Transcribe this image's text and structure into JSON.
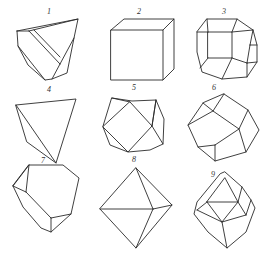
{
  "figure": {
    "title": "",
    "layout": "3x3 grid",
    "line_color": "#2a2a2a",
    "background": "#ffffff"
  },
  "crystals": [
    {
      "label": "1",
      "shape": "irregular truncated crystal with diagonal face"
    },
    {
      "label": "2",
      "shape": "cube"
    },
    {
      "label": "3",
      "shape": "truncated cube / cuboctahedral form"
    },
    {
      "label": "4",
      "shape": "tetrahedron"
    },
    {
      "label": "5",
      "shape": "cuboctahedron"
    },
    {
      "label": "6",
      "shape": "rhombic dodecahedron"
    },
    {
      "label": "7",
      "shape": "truncated irregular polyhedron"
    },
    {
      "label": "8",
      "shape": "octahedron"
    },
    {
      "label": "9",
      "shape": "modified octahedron with beveled edges"
    }
  ]
}
